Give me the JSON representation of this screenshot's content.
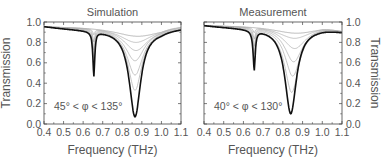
{
  "chart_data": [
    {
      "type": "line",
      "title": "Simulation",
      "xlabel": "Frequency (THz)",
      "ylabel": "Transmission",
      "xlim": [
        0.4,
        1.1
      ],
      "ylim": [
        0.0,
        1.0
      ],
      "xticks": [
        "0.4",
        "0.5",
        "0.6",
        "0.7",
        "0.8",
        "0.9",
        "1.0",
        "1.1"
      ],
      "yticks": [
        "0.0",
        "0.2",
        "0.4",
        "0.6",
        "0.8",
        "1.0"
      ],
      "annotation": "45° < φ < 135°",
      "ylabel_side": "left",
      "dip1": {
        "x": 0.655,
        "min": 0.44,
        "width": 0.012
      },
      "series": [
        {
          "name": "φ=45°",
          "color": "#999",
          "dip2_x": 0.88,
          "dip2_min": 0.86,
          "width": 0.3,
          "edge_hi": 0.96
        },
        {
          "name": "φ=55°",
          "color": "#aaa",
          "dip2_x": 0.87,
          "dip2_min": 0.8,
          "width": 0.2,
          "edge_hi": 0.95
        },
        {
          "name": "φ=65°",
          "color": "#aaa",
          "dip2_x": 0.87,
          "dip2_min": 0.72,
          "width": 0.15,
          "edge_hi": 0.94
        },
        {
          "name": "φ=75°",
          "color": "#aaa",
          "dip2_x": 0.865,
          "dip2_min": 0.62,
          "width": 0.12,
          "edge_hi": 0.93
        },
        {
          "name": "φ=85°",
          "color": "#aaa",
          "dip2_x": 0.865,
          "dip2_min": 0.48,
          "width": 0.1,
          "edge_hi": 0.93
        },
        {
          "name": "φ=95°",
          "color": "#aaa",
          "dip2_x": 0.865,
          "dip2_min": 0.33,
          "width": 0.085,
          "edge_hi": 0.93
        },
        {
          "name": "φ=135°",
          "color": "#111",
          "dip2_x": 0.865,
          "dip2_min": 0.07,
          "width": 0.07,
          "edge_hi": 0.94,
          "bold": true
        }
      ]
    },
    {
      "type": "line",
      "title": "Measurement",
      "xlabel": "Frequency (THz)",
      "ylabel": "Transmission",
      "xlim": [
        0.4,
        1.1
      ],
      "ylim": [
        0.0,
        1.0
      ],
      "xticks": [
        "0.4",
        "0.5",
        "0.6",
        "0.7",
        "0.8",
        "0.9",
        "1.0",
        "1.1"
      ],
      "yticks": [
        "0.0",
        "0.2",
        "0.4",
        "0.6",
        "0.8",
        "1.0"
      ],
      "annotation": "40° < φ < 130°",
      "ylabel_side": "right",
      "dip1": {
        "x": 0.655,
        "min": 0.49,
        "width": 0.014
      },
      "series": [
        {
          "name": "φ=40°",
          "color": "#999",
          "dip2_x": 0.87,
          "dip2_min": 0.89,
          "width": 0.3,
          "edge_hi": 0.88
        },
        {
          "name": "φ=50°",
          "color": "#aaa",
          "dip2_x": 0.86,
          "dip2_min": 0.84,
          "width": 0.2,
          "edge_hi": 0.88
        },
        {
          "name": "φ=60°",
          "color": "#aaa",
          "dip2_x": 0.86,
          "dip2_min": 0.74,
          "width": 0.14,
          "edge_hi": 0.88
        },
        {
          "name": "φ=70°",
          "color": "#aaa",
          "dip2_x": 0.855,
          "dip2_min": 0.61,
          "width": 0.11,
          "edge_hi": 0.88
        },
        {
          "name": "φ=80°",
          "color": "#aaa",
          "dip2_x": 0.85,
          "dip2_min": 0.47,
          "width": 0.095,
          "edge_hi": 0.88
        },
        {
          "name": "φ=90°",
          "color": "#aaa",
          "dip2_x": 0.845,
          "dip2_min": 0.31,
          "width": 0.085,
          "edge_hi": 0.88
        },
        {
          "name": "φ=130°",
          "color": "#111",
          "dip2_x": 0.84,
          "dip2_min": 0.1,
          "width": 0.07,
          "edge_hi": 0.88,
          "bold": true
        }
      ]
    }
  ],
  "panels": {
    "left": {
      "title": "Simulation",
      "annotation": "45° < φ < 135°",
      "xlabel": "Frequency (THz)",
      "ylabel": "Transmission"
    },
    "right": {
      "title": "Measurement",
      "annotation": "40° < φ < 130°",
      "xlabel": "Frequency (THz)",
      "ylabel": "Transmission"
    }
  }
}
